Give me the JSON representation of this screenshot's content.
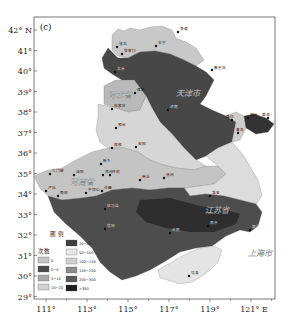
{
  "panel_label": "(c)",
  "axes": {
    "y_ticks": [
      "42° N",
      "41°",
      "40°",
      "39°",
      "38°",
      "37°",
      "36°",
      "35°",
      "34°",
      "33°",
      "32°",
      "31°",
      "30°",
      "29°"
    ],
    "x_ticks": [
      "111°",
      "113°",
      "115°",
      "117°",
      "119°",
      "121° E"
    ]
  },
  "provinces": {
    "hebei": "河北省",
    "henan": "河南省",
    "jiangsu": "江苏省",
    "tianjin": "天津市",
    "shanghai": "上海市"
  },
  "cities": {
    "zhangbei": "张北",
    "zhangjiakou": "张家口",
    "chengde": "承德",
    "fengning": "丰宁",
    "qinhuangdao": "秦皇岛",
    "huailai": "怀来",
    "beijing": "北京",
    "baoding": "保定",
    "shijiazhuang": "石家庄",
    "xingtai": "邢台",
    "handan": "邯郸",
    "anyang": "安阳",
    "xinxiang": "新乡",
    "zhengzhou": "郑州",
    "kaifeng": "开封",
    "luoyang": "洛阳",
    "sanmenxia": "三门峡",
    "lushi": "卢氏",
    "xuchang": "许昌",
    "pingdingshan": "平顶山",
    "zhumadian": "驻马店",
    "nanyang": "南阳",
    "xinyang": "信阳",
    "shangqiu": "商丘",
    "xuzhou": "徐州",
    "jinan": "济南",
    "qingdao": "青岛",
    "weifang": "潍坊",
    "yantai": "烟台",
    "weihai": "威海",
    "huaian": "淮安",
    "nanjing": "南京",
    "hefei": "合肥",
    "nantong": "南通",
    "tunxi": "屯溪"
  },
  "legend": {
    "title": "图 例",
    "subtitle": "次数",
    "items": [
      {
        "label": "0",
        "color": "#c4c4c4"
      },
      {
        "label": "0~5",
        "color": "#4a4a4a"
      },
      {
        "label": "5~10",
        "color": "#a8a8a8"
      },
      {
        "label": "10~20",
        "color": "#d2d2d2"
      },
      {
        "label": "20~50",
        "color": "#3e3e3e"
      },
      {
        "label": "50~100",
        "color": "#e6e6e6"
      },
      {
        "label": "100~150",
        "color": "#cfcfcf"
      },
      {
        "label": "150~200",
        "color": "#8a8a8a"
      },
      {
        "label": "200~300",
        "color": "#5a5a5a"
      },
      {
        "label": ">300",
        "color": "#1e1e1e"
      }
    ]
  }
}
